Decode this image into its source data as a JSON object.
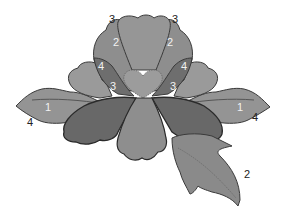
{
  "diagram": {
    "colors": {
      "background": "#ffffff",
      "outline": "#3a3a3a",
      "light": "#9a9a9a",
      "medium": "#8a8a8a",
      "dark": "#6e6e6e",
      "darker": "#606060",
      "label_dark": "#222222",
      "label_light": "#f2f2f2"
    },
    "labels": [
      {
        "id": "top-left-3",
        "text": "3",
        "x": 109,
        "y": 23,
        "color": "label_dark"
      },
      {
        "id": "top-right-3",
        "text": "3",
        "x": 172,
        "y": 23,
        "color": "label_dark"
      },
      {
        "id": "petal-left-2",
        "text": "2",
        "x": 113,
        "y": 46,
        "color": "label_light"
      },
      {
        "id": "petal-right-2",
        "text": "2",
        "x": 167,
        "y": 46,
        "color": "label_light"
      },
      {
        "id": "side-left-4",
        "text": "4",
        "x": 98,
        "y": 70,
        "color": "label_light"
      },
      {
        "id": "side-right-4",
        "text": "4",
        "x": 181,
        "y": 70,
        "color": "label_light"
      },
      {
        "id": "inner-left-3",
        "text": "3",
        "x": 110,
        "y": 90,
        "color": "label_light"
      },
      {
        "id": "inner-right-3",
        "text": "3",
        "x": 170,
        "y": 90,
        "color": "label_light"
      },
      {
        "id": "leaf-left-1",
        "text": "1",
        "x": 45,
        "y": 111,
        "color": "label_light"
      },
      {
        "id": "leaf-right-1",
        "text": "1",
        "x": 237,
        "y": 111,
        "color": "label_light"
      },
      {
        "id": "leaf-left-4",
        "text": "4",
        "x": 27,
        "y": 126,
        "color": "label_dark"
      },
      {
        "id": "leaf-right-4",
        "text": "4",
        "x": 252,
        "y": 121,
        "color": "label_dark"
      },
      {
        "id": "leaf-bottom-2",
        "text": "2",
        "x": 244,
        "y": 178,
        "color": "label_dark"
      }
    ]
  }
}
